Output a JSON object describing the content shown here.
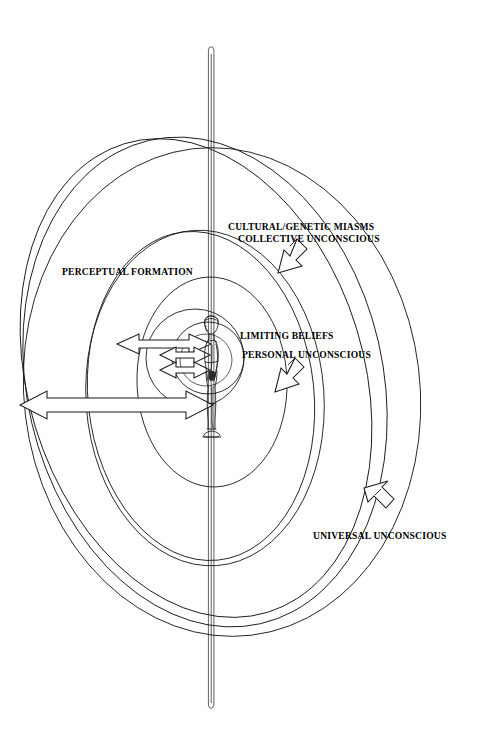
{
  "diagram": {
    "background_color": "#ffffff",
    "stroke_color": "#000000",
    "labels": [
      {
        "id": "cultural-genetic-miasms",
        "line1": "CULTURAL/GENETIC MIASMS",
        "line2": "COLLECTIVE UNCONSCIOUS"
      },
      {
        "id": "perceptual-formation",
        "line1": "PERCEPTUAL FORMATION"
      },
      {
        "id": "limiting-beliefs",
        "line1": "LIMITING BELIEFS",
        "line2": "PERSONAL UNCONSCIOUS"
      },
      {
        "id": "universal-unconscious",
        "line1": "UNIVERSAL UNCONSCIOUS"
      }
    ],
    "pointer_arrows": [
      {
        "id": "arrow-collective-unconscious",
        "direction": "down-left"
      },
      {
        "id": "arrow-personal-unconscious",
        "direction": "down-left"
      },
      {
        "id": "arrow-universal-unconscious",
        "direction": "up-left"
      }
    ],
    "measure_arrows": [
      {
        "id": "measure-arrow-outer",
        "direction": "double-headed-horizontal",
        "level": "outer"
      },
      {
        "id": "measure-arrow-middle",
        "direction": "double-headed-horizontal",
        "level": "middle"
      },
      {
        "id": "measure-arrow-inner",
        "direction": "double-headed-horizontal",
        "level": "inner"
      }
    ],
    "figure": {
      "id": "human-figure",
      "description": "standing human figure in side profile"
    },
    "axis": {
      "id": "vertical-axis-rod",
      "description": "thin vertical rod through the figure"
    }
  }
}
